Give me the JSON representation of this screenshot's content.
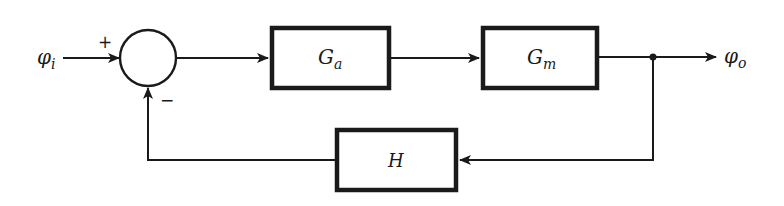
{
  "diagram": {
    "type": "feedback-control-block-diagram",
    "input": {
      "symbol": "φ",
      "subscript": "i"
    },
    "output": {
      "symbol": "φ",
      "subscript": "o"
    },
    "summing_junction": {
      "plus_sign": "+",
      "minus_sign": "−"
    },
    "blocks": {
      "forward_1": {
        "symbol": "G",
        "subscript": "a"
      },
      "forward_2": {
        "symbol": "G",
        "subscript": "m"
      },
      "feedback": {
        "symbol": "H",
        "subscript": ""
      }
    },
    "colors": {
      "line": "#1a1a1a",
      "background": "#ffffff"
    }
  }
}
